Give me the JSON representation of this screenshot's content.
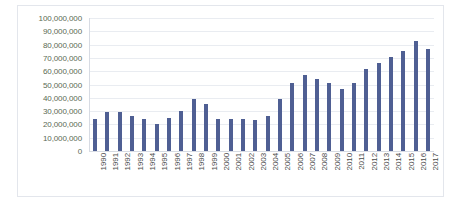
{
  "chart_data": {
    "type": "bar",
    "title": "",
    "subtitle": "",
    "xlabel": "",
    "ylabel": "",
    "grid": true,
    "legend": false,
    "legend_position": "none",
    "ylim": [
      0,
      100000000
    ],
    "ytick_labels": [
      "100,000,000",
      "90,000,000",
      "80,000,000",
      "70,000,000",
      "60,000,000",
      "50,000,000",
      "40,000,000",
      "30,000,000",
      "20,000,000",
      "10,000,000",
      "0"
    ],
    "ytick_values": [
      100000000,
      90000000,
      80000000,
      70000000,
      60000000,
      50000000,
      40000000,
      30000000,
      20000000,
      10000000,
      0
    ],
    "categories": [
      "1990",
      "1991",
      "1992",
      "1993",
      "1994",
      "1995",
      "1996",
      "1997",
      "1998",
      "1999",
      "2000",
      "2001",
      "2002",
      "2003",
      "2004",
      "2005",
      "2006",
      "2007",
      "2008",
      "2009",
      "2010",
      "2011",
      "2012",
      "2013",
      "2014",
      "2015",
      "2016",
      "2017"
    ],
    "values": [
      24000000,
      29000000,
      29500000,
      26000000,
      24000000,
      20000000,
      25000000,
      30000000,
      39000000,
      35000000,
      24000000,
      24000000,
      24000000,
      23000000,
      26000000,
      39000000,
      51000000,
      57000000,
      54000000,
      51000000,
      47000000,
      51000000,
      62000000,
      66000000,
      71000000,
      75000000,
      83000000,
      77000000
    ],
    "series": [
      {
        "name": "Series 1",
        "color": "#4f5f93",
        "values": [
          24000000,
          29000000,
          29500000,
          26000000,
          24000000,
          20000000,
          25000000,
          30000000,
          39000000,
          35000000,
          24000000,
          24000000,
          24000000,
          23000000,
          26000000,
          39000000,
          51000000,
          57000000,
          54000000,
          51000000,
          47000000,
          51000000,
          62000000,
          66000000,
          71000000,
          75000000,
          83000000,
          77000000
        ]
      }
    ]
  },
  "style": {
    "bar_color": "#4f5f93",
    "gridline_color": "#e9ecf1",
    "axis_color": "#d7dbe3",
    "y_label_color": "#5a6a54",
    "x_label_color": "#4a4a4a",
    "plot_background": "#ffffff",
    "border_color": "#e3e6ec"
  }
}
